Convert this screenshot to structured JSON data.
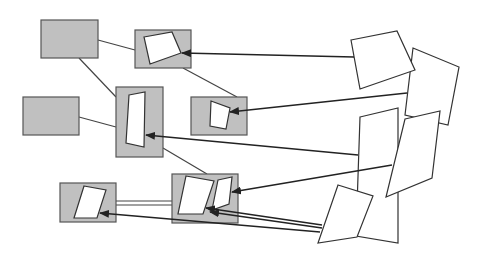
{
  "diagram": {
    "width": 482,
    "height": 255,
    "colors": {
      "background": "#ffffff",
      "box_fill": "#c0c0c0",
      "box_stroke": "#555555",
      "quad_fill": "#ffffff",
      "line": "#444444",
      "arrow": "#222222"
    },
    "boxes": [
      {
        "id": "box-a",
        "x": 41,
        "y": 20,
        "w": 57,
        "h": 38
      },
      {
        "id": "box-b",
        "x": 135,
        "y": 30,
        "w": 56,
        "h": 38
      },
      {
        "id": "box-c",
        "x": 23,
        "y": 97,
        "w": 56,
        "h": 38
      },
      {
        "id": "box-d",
        "x": 116,
        "y": 87,
        "w": 47,
        "h": 70
      },
      {
        "id": "box-e",
        "x": 191,
        "y": 97,
        "w": 56,
        "h": 38
      },
      {
        "id": "box-f",
        "x": 60,
        "y": 183,
        "w": 56,
        "h": 39
      },
      {
        "id": "box-g",
        "x": 172,
        "y": 174,
        "w": 66,
        "h": 49
      }
    ],
    "inner_quads": [
      {
        "id": "quad-b",
        "points": "144,37 172,32 181,53 150,64"
      },
      {
        "id": "quad-d",
        "points": "129,95 145,92 144,147 126,143"
      },
      {
        "id": "quad-e",
        "points": "211,101 230,108 226,129 210,126"
      },
      {
        "id": "quad-f",
        "points": "84,186 106,190 97,218 74,218"
      },
      {
        "id": "quad-g1",
        "points": "186,176 214,181 203,214 178,214"
      },
      {
        "id": "quad-g2",
        "points": "218,180 232,177 229,204 212,210"
      }
    ],
    "source_quads": [
      {
        "id": "source-r3",
        "points": "360,117 398,108 398,243 356,236"
      },
      {
        "id": "source-r2",
        "points": "413,48 459,67 448,125 405,115"
      },
      {
        "id": "source-r1",
        "points": "351,40 397,31 415,70 360,89"
      },
      {
        "id": "source-r4",
        "points": "405,119 440,111 432,178 386,197"
      },
      {
        "id": "source-r5",
        "points": "338,185 373,196 357,237 318,243"
      }
    ],
    "connectors": [
      {
        "id": "link-a-b",
        "x1": 98,
        "y1": 40,
        "x2": 135,
        "y2": 50
      },
      {
        "id": "link-a-d",
        "x1": 79,
        "y1": 58,
        "x2": 116,
        "y2": 97
      },
      {
        "id": "link-c-d",
        "x1": 79,
        "y1": 117,
        "x2": 116,
        "y2": 127
      },
      {
        "id": "link-b-e",
        "x1": 183,
        "y1": 68,
        "x2": 237,
        "y2": 97
      },
      {
        "id": "link-d-g",
        "x1": 163,
        "y1": 148,
        "x2": 207,
        "y2": 174
      },
      {
        "id": "link-f-g-top",
        "x1": 116,
        "y1": 201,
        "x2": 172,
        "y2": 201
      },
      {
        "id": "link-f-g-bottom",
        "x1": 116,
        "y1": 205,
        "x2": 172,
        "y2": 205
      }
    ],
    "arrows": [
      {
        "id": "arrow-r1-to-b",
        "x1": 354,
        "y1": 57,
        "x2": 182,
        "y2": 53
      },
      {
        "id": "arrow-r2-to-e",
        "x1": 407,
        "y1": 93,
        "x2": 230,
        "y2": 112
      },
      {
        "id": "arrow-r3-to-d",
        "x1": 358,
        "y1": 155,
        "x2": 146,
        "y2": 135
      },
      {
        "id": "arrow-r4-to-g2",
        "x1": 392,
        "y1": 165,
        "x2": 232,
        "y2": 192
      },
      {
        "id": "arrow-r5-to-g",
        "x1": 322,
        "y1": 225,
        "x2": 206,
        "y2": 208
      },
      {
        "id": "arrow-r5-to-g-b",
        "x1": 322,
        "y1": 228,
        "x2": 210,
        "y2": 212
      },
      {
        "id": "arrow-r5-to-f",
        "x1": 320,
        "y1": 232,
        "x2": 100,
        "y2": 213
      }
    ]
  }
}
